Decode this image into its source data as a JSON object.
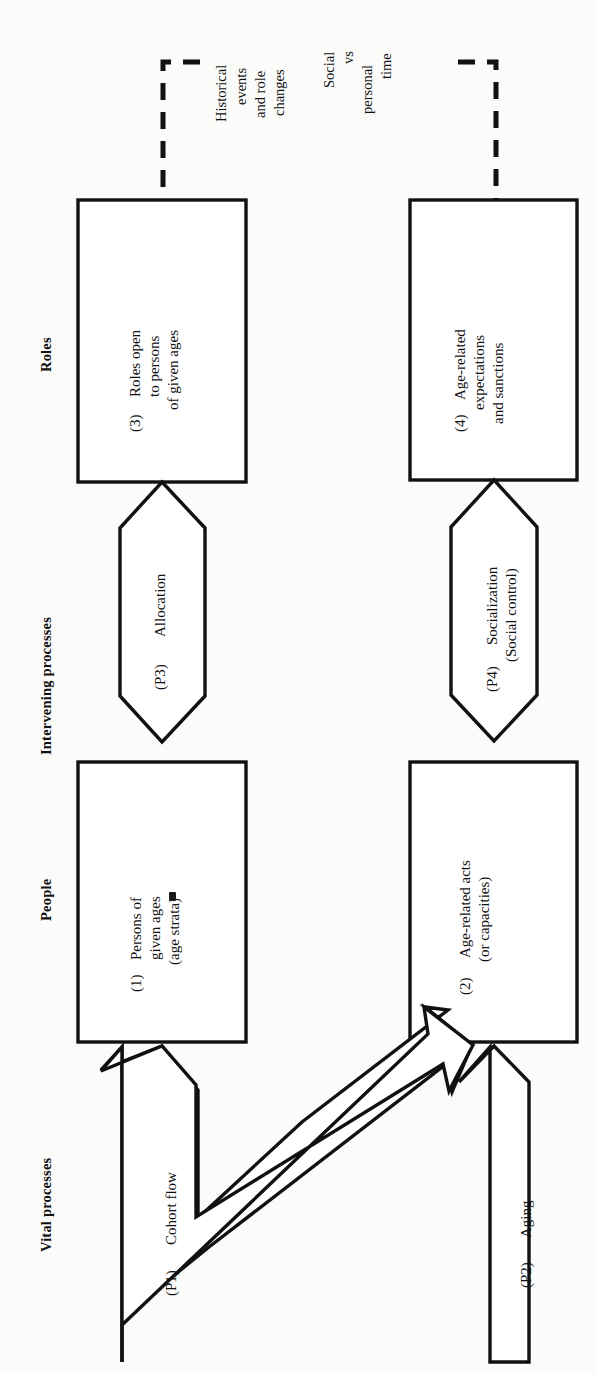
{
  "figure": {
    "orientation": "text rotated 90 degrees counter-clockwise (landscape diagram on portrait page)",
    "background_color": "#fbfbfa",
    "ink_color": "#111111"
  },
  "column_headers": [
    {
      "id": "roles",
      "label": "Roles"
    },
    {
      "id": "intervening-processes",
      "label": "Intervening processes"
    },
    {
      "id": "people",
      "label": "People"
    },
    {
      "id": "vital-processes",
      "label": "Vital processes"
    }
  ],
  "boxes": [
    {
      "id": "box-3",
      "number": "(3)",
      "lines": [
        "Roles open",
        "to persons",
        "of given ages"
      ],
      "column": "Roles"
    },
    {
      "id": "box-4",
      "number": "(4)",
      "lines": [
        "Age-related",
        "expectations",
        "and sanctions"
      ],
      "column": "Roles"
    },
    {
      "id": "box-1",
      "number": "(1)",
      "lines": [
        "Persons of",
        "given ages",
        "(age strata)"
      ],
      "column": "People"
    },
    {
      "id": "box-2",
      "number": "(2)",
      "lines": [
        "Age-related acts",
        "(or capacities)"
      ],
      "column": "People"
    }
  ],
  "hexagons": [
    {
      "id": "process-p3",
      "number": "(P3)",
      "lines": [
        "Allocation"
      ],
      "column": "Intervening processes"
    },
    {
      "id": "process-p4",
      "number": "(P4)",
      "lines": [
        "Socialization",
        "(Social control)"
      ],
      "column": "Intervening processes"
    }
  ],
  "block_arrows": [
    {
      "id": "process-p1",
      "number": "(P1)",
      "label": "Cohort flow",
      "column": "Vital processes",
      "shape": "forked block arrow: one head into box (1), one diagonal head into box (2)"
    },
    {
      "id": "process-p2",
      "number": "(P2)",
      "label": "Aging",
      "column": "Vital processes",
      "shape": "block arrow pointing into box (2)"
    }
  ],
  "dashed_annotations": [
    {
      "id": "annotation-historical-events",
      "lines": [
        "Historical",
        "events",
        "and role",
        "changes"
      ],
      "connects_to": "box-3"
    },
    {
      "id": "annotation-social-vs-personal-time",
      "lines": [
        "Social",
        "vs",
        "personal",
        "time"
      ],
      "connects_to": "box-4"
    }
  ]
}
